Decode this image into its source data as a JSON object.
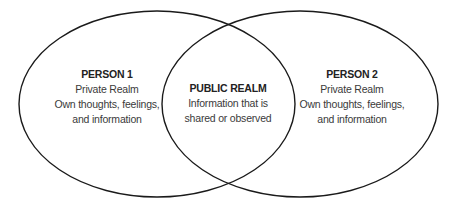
{
  "diagram": {
    "type": "venn",
    "stroke_color": "#1a1a1a",
    "sets": [
      {
        "id": "person-1",
        "title": "PERSON 1",
        "lines": [
          "Private Realm",
          "Own thoughts, feelings,",
          "and information"
        ]
      },
      {
        "id": "person-2",
        "title": "PERSON 2",
        "lines": [
          "Private Realm",
          "Own thoughts, feelings,",
          "and information"
        ]
      }
    ],
    "intersection": {
      "title": "PUBLIC REALM",
      "lines": [
        "Information that is",
        "shared or observed"
      ]
    }
  }
}
